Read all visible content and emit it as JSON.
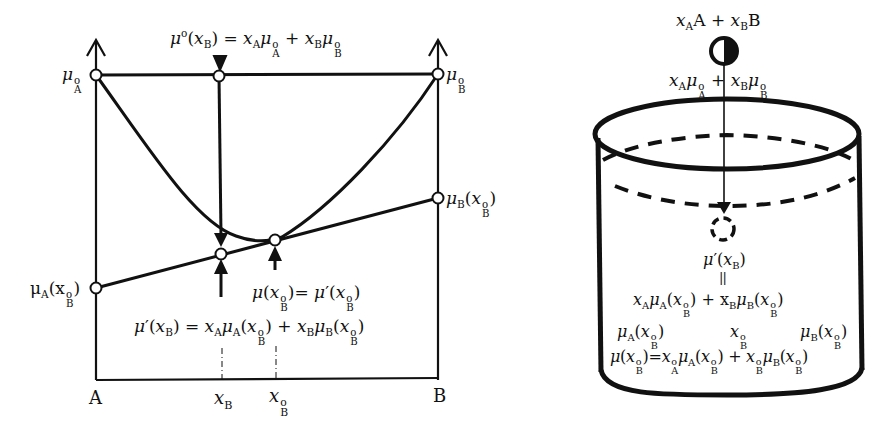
{
  "left_diagram": {
    "axis_left_label": "A",
    "axis_right_label": "B",
    "tick_xB": "x_B",
    "tick_xB0": "x°_B",
    "label_muA0": "μ°_A",
    "label_muB0": "μ°_B",
    "label_muA_xB0": "μ_A(x°_B)",
    "label_muB_xB0": "μ_B(x°_B)",
    "eq_top": "μ°(x_B) = x_A μ°_A + x_B μ°_B",
    "eq_tangent_point": "μ(x°_B) = μ'(x°_B)",
    "eq_bottom": "μ'(x_B) = x_A μ_A(x°_B) + x_B μ_B(x°_B)"
  },
  "right_diagram": {
    "mixture_label": "x_A A + x_B B",
    "mixture_potential": "x_A μ°_A + x_B μ°_B",
    "mu_prime": "μ'(x_B)",
    "equals_sign": "||",
    "mu_prime_expansion": "x_A μ_A(x°_B) + x_B μ_B(x°_B)",
    "col_muA": "μ_A(x°_B)",
    "col_xB0": "x°_B",
    "col_muB": "μ_B(x°_B)",
    "bath_equation": "μ(x°_B) = x°_A μ_A(x°_B) + x°_B μ_B(x°_B)"
  }
}
